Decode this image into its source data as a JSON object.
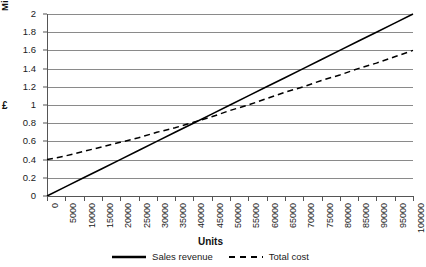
{
  "chart_data": {
    "type": "line",
    "title": "",
    "xlabel": "Units",
    "ylabel": "£",
    "yaxis_unit_label": "Millions",
    "xlim": [
      0,
      100000
    ],
    "ylim": [
      0,
      2
    ],
    "grid": true,
    "legend_position": "bottom",
    "y_ticks": [
      "0",
      "0.2",
      "0.4",
      "0.6",
      "0.8",
      "1",
      "1.2",
      "1.4",
      "1.6",
      "1.8",
      "2"
    ],
    "y_tick_values": [
      0,
      0.2,
      0.4,
      0.6,
      0.8,
      1,
      1.2,
      1.4,
      1.6,
      1.8,
      2
    ],
    "x_ticks": [
      "0",
      "5000",
      "10000",
      "15000",
      "20000",
      "25000",
      "30000",
      "35000",
      "40000",
      "45000",
      "50000",
      "55000",
      "60000",
      "65000",
      "70000",
      "75000",
      "80000",
      "85000",
      "90000",
      "95000",
      "100000"
    ],
    "x": [
      0,
      5000,
      10000,
      15000,
      20000,
      25000,
      30000,
      35000,
      40000,
      45000,
      50000,
      55000,
      60000,
      65000,
      70000,
      75000,
      80000,
      85000,
      90000,
      95000,
      100000
    ],
    "series": [
      {
        "name": "Sales revenue",
        "style": "solid",
        "color": "#000000",
        "values": [
          0,
          0.1,
          0.2,
          0.3,
          0.4,
          0.5,
          0.6,
          0.7,
          0.8,
          0.9,
          1.0,
          1.1,
          1.2,
          1.3,
          1.4,
          1.5,
          1.6,
          1.7,
          1.8,
          1.9,
          2.0
        ]
      },
      {
        "name": "Total cost",
        "style": "dashed",
        "color": "#000000",
        "values": [
          0.4,
          0.44,
          0.49,
          0.54,
          0.59,
          0.64,
          0.7,
          0.75,
          0.81,
          0.87,
          0.94,
          1.0,
          1.07,
          1.14,
          1.2,
          1.27,
          1.33,
          1.4,
          1.46,
          1.53,
          1.6
        ]
      }
    ],
    "annotations": {
      "break_even_units": 50000,
      "break_even_value": 1.0,
      "fixed_cost_intercept": 0.4
    }
  },
  "legend": {
    "items": [
      {
        "label": "Sales revenue"
      },
      {
        "label": "Total cost"
      }
    ]
  }
}
